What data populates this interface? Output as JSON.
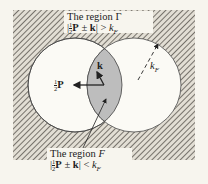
{
  "diagram": {
    "colors": {
      "background": "#f7f5ee",
      "hatch": "#5a5650",
      "lens_fill": "#bdbdbd",
      "stroke": "#222222"
    },
    "top_label": {
      "line1_prefix": "The region ",
      "line1_symbol": "Γ",
      "abs_open": "|",
      "frac_num": "1",
      "frac_den": "2",
      "vec_P": "P",
      "op": " ± ",
      "vec_k": "k",
      "abs_close": "|",
      "relation": " > ",
      "kF_base": "k",
      "kF_sub": "F"
    },
    "bottom_label": {
      "line1_prefix": "The region ",
      "line1_symbol": "F",
      "abs_open": "|",
      "frac_num": "1",
      "frac_den": "2",
      "vec_P": "P",
      "op": " ± ",
      "vec_k": "k",
      "abs_close": "|",
      "relation": " < ",
      "kF_base": "k",
      "kF_sub": "F"
    },
    "vector_labels": {
      "halfP_num": "1",
      "halfP_den": "2",
      "halfP_vec": "P",
      "k_vec": "k",
      "radius_base": "k",
      "radius_sub": "F"
    }
  }
}
